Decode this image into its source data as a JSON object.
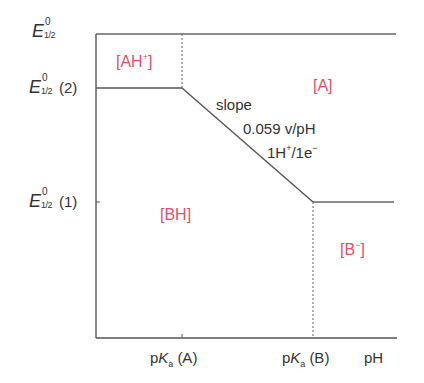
{
  "diagram": {
    "type": "Pourbaix-like E vs pH diagram",
    "y_labels": [
      {
        "symbol": "E",
        "sup": "0",
        "sub": "1/2",
        "suffix": ""
      },
      {
        "symbol": "E",
        "sup": "0",
        "sub": "1/2",
        "suffix": "(2)"
      },
      {
        "symbol": "E",
        "sup": "0",
        "sub": "1/2",
        "suffix": "(1)"
      }
    ],
    "x_labels": {
      "pka_a": {
        "prefix": "p",
        "K": "K",
        "sub": "a",
        "suffix": "(A)"
      },
      "pka_b": {
        "prefix": "p",
        "K": "K",
        "sub": "a",
        "suffix": "(B)"
      },
      "ph": "pH"
    },
    "regions": {
      "ah_plus": {
        "base": "[AH",
        "sup": "+",
        "close": "]"
      },
      "a": "[A]",
      "bh": "[BH]",
      "b_minus": {
        "base": "[B",
        "sup": "−",
        "close": "]"
      }
    },
    "slope_annotation": {
      "line1": "slope",
      "line2": "0.059 v/pH",
      "line3_a": "1H",
      "line3_sup1": "+",
      "line3_b": "/1e",
      "line3_sup2": "−"
    },
    "colors": {
      "line": "#555555",
      "region_label": "#e0506a",
      "text": "#333333"
    }
  }
}
